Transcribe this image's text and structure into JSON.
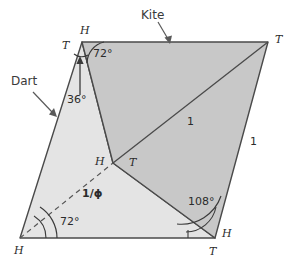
{
  "figure": {
    "background_color": "#ffffff",
    "kite_fill": "#c9c9c9",
    "dart_fill": "#e3e3e3",
    "stroke_color": "#4a4a4a",
    "text_color": "#2b2b2b"
  },
  "piece_labels": {
    "kite": "Kite",
    "dart": "Dart"
  },
  "vertex_labels": {
    "top_left_h": "H",
    "top_left_t": "T",
    "top_right_t": "T",
    "center_h": "H",
    "center_t": "T",
    "bottom_left_h": "H",
    "bottom_right_h": "H",
    "bottom_right_t": "T"
  },
  "angle_labels": {
    "apex_72": "72°",
    "dart_36": "36°",
    "base_72": "72°",
    "kite_108": "108°"
  },
  "length_labels": {
    "diagonal_unit": "1",
    "right_edge_unit": "1",
    "dashed_phi": "1/ϕ"
  },
  "geometry": {
    "vertices": {
      "top_left": [
        82,
        42
      ],
      "top_right": [
        268,
        42
      ],
      "bottom_left": [
        20,
        238
      ],
      "bottom_right": [
        215,
        238
      ],
      "center": [
        113,
        163
      ]
    },
    "kite_polygon": "82,42 268,42 215,238 113,163",
    "dart_polygon": "82,42 113,163 215,238 20,238",
    "kite_diagonal": "113,163 268,42",
    "dashed_segment": "20,238 113,163"
  }
}
